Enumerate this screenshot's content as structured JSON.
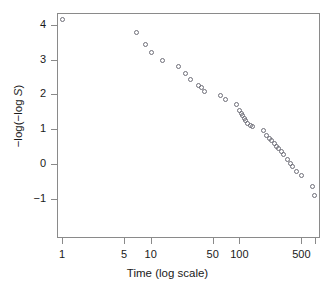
{
  "chart_data": {
    "type": "scatter",
    "title": "",
    "xlabel": "Time (log scale)",
    "ylabel": "−log(−log S)",
    "ylabel_parts": {
      "prefix": "−log(−log ",
      "italic": "S",
      "suffix": ")"
    },
    "x_scale": "log",
    "y_scale": "linear",
    "grid": false,
    "legend": null,
    "xlim": [
      0.85,
      900
    ],
    "ylim": [
      -1.45,
      4.45
    ],
    "xticks": [
      1,
      5,
      10,
      50,
      100,
      500
    ],
    "xticklabels": [
      "1",
      "5",
      "10",
      "50",
      "100",
      "500"
    ],
    "yticks": [
      -1,
      0,
      1,
      2,
      3,
      4
    ],
    "yticklabels": [
      "−1",
      "0",
      "1",
      "2",
      "3",
      "4"
    ],
    "marker": "open-circle",
    "marker_color": "#6e6e78",
    "points": [
      {
        "x": 1.0,
        "y": 4.18
      },
      {
        "x": 6.9,
        "y": 3.8
      },
      {
        "x": 8.7,
        "y": 3.46
      },
      {
        "x": 10.2,
        "y": 3.21
      },
      {
        "x": 13.3,
        "y": 3.0
      },
      {
        "x": 20.5,
        "y": 2.83
      },
      {
        "x": 24.5,
        "y": 2.61
      },
      {
        "x": 28.0,
        "y": 2.45
      },
      {
        "x": 34.0,
        "y": 2.28
      },
      {
        "x": 36.5,
        "y": 2.22
      },
      {
        "x": 39.5,
        "y": 2.11
      },
      {
        "x": 61.0,
        "y": 1.99
      },
      {
        "x": 68.0,
        "y": 1.88
      },
      {
        "x": 92.0,
        "y": 1.73
      },
      {
        "x": 100.0,
        "y": 1.56
      },
      {
        "x": 104.0,
        "y": 1.47
      },
      {
        "x": 108.0,
        "y": 1.4
      },
      {
        "x": 112.0,
        "y": 1.33
      },
      {
        "x": 116.0,
        "y": 1.26
      },
      {
        "x": 122.0,
        "y": 1.18
      },
      {
        "x": 131.0,
        "y": 1.12
      },
      {
        "x": 140.0,
        "y": 1.09
      },
      {
        "x": 186.0,
        "y": 0.97
      },
      {
        "x": 200.0,
        "y": 0.83
      },
      {
        "x": 214.0,
        "y": 0.74
      },
      {
        "x": 228.0,
        "y": 0.68
      },
      {
        "x": 243.0,
        "y": 0.61
      },
      {
        "x": 258.0,
        "y": 0.53
      },
      {
        "x": 275.0,
        "y": 0.45
      },
      {
        "x": 294.0,
        "y": 0.38
      },
      {
        "x": 313.0,
        "y": 0.29
      },
      {
        "x": 345.0,
        "y": 0.13
      },
      {
        "x": 372.0,
        "y": 0.02
      },
      {
        "x": 392.0,
        "y": -0.06
      },
      {
        "x": 430.0,
        "y": -0.21
      },
      {
        "x": 490.0,
        "y": -0.33
      },
      {
        "x": 660.0,
        "y": -0.62
      },
      {
        "x": 700.0,
        "y": -0.88
      }
    ]
  }
}
